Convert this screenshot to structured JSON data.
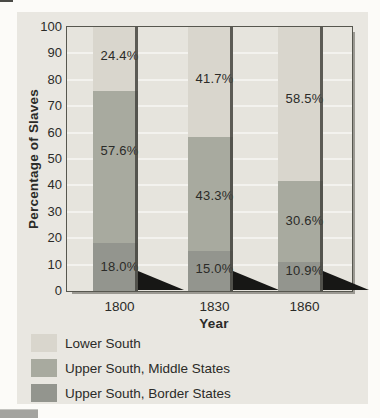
{
  "page": {
    "background": "#fcfbf8",
    "panel_background": "#e9e7e1"
  },
  "chart_data": {
    "type": "bar",
    "stacked": true,
    "stack_unit": "percent",
    "title": "",
    "xlabel": "Year",
    "ylabel": "Percentage of Slaves",
    "ylim": [
      0,
      100
    ],
    "ytick_step": 10,
    "grid": true,
    "categories": [
      "1800",
      "1830",
      "1860"
    ],
    "series": [
      {
        "name": "Upper South, Border States",
        "color": "#93958e",
        "values": [
          18.0,
          15.0,
          10.9
        ],
        "value_labels": [
          "18.0%",
          "15.0%",
          "10.9%"
        ]
      },
      {
        "name": "Upper South, Middle States",
        "color": "#a8aa9f",
        "values": [
          57.6,
          43.3,
          30.6
        ],
        "value_labels": [
          "57.6%",
          "43.3%",
          "30.6%"
        ]
      },
      {
        "name": "Lower South",
        "color": "#d9d6cd",
        "values": [
          24.4,
          41.7,
          58.5
        ],
        "value_labels": [
          "24.4%",
          "41.7%",
          "58.5%"
        ]
      }
    ],
    "legend": {
      "position": "bottom-left",
      "entries": [
        {
          "label": "Lower South",
          "color": "#d9d6cd"
        },
        {
          "label": "Upper South, Middle States",
          "color": "#a8aa9f"
        },
        {
          "label": "Upper South, Border States",
          "color": "#93958e"
        }
      ]
    },
    "plot_background": "#e6e4dd",
    "gridline_color": "#f3f2ee",
    "bar_edge_color": "#45453f",
    "bar_shadow_color": "#171715",
    "frame_color": "#57574f",
    "text_color": "#2b2b28"
  }
}
